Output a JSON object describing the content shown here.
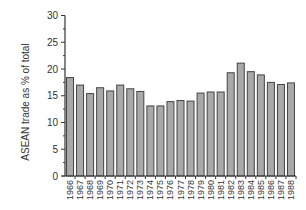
{
  "chart_data": {
    "type": "bar",
    "title": "",
    "xlabel": "",
    "ylabel": "ASEAN trade as % of total",
    "ylim": [
      0,
      30
    ],
    "yticks": [
      0,
      5,
      10,
      15,
      20,
      25,
      30
    ],
    "grid": false,
    "legend": null,
    "categories": [
      "1966",
      "1967",
      "1968",
      "1969",
      "1970",
      "1971",
      "1972",
      "1973",
      "1974",
      "1975",
      "1976",
      "1977",
      "1978",
      "1979",
      "1980",
      "1981",
      "1982",
      "1983",
      "1984",
      "1985",
      "1986",
      "1987",
      "1988"
    ],
    "values": [
      18.4,
      17.0,
      15.4,
      16.5,
      15.9,
      17.0,
      16.3,
      15.8,
      13.1,
      13.1,
      13.9,
      14.1,
      14.0,
      15.5,
      15.7,
      15.7,
      19.3,
      21.1,
      19.5,
      18.9,
      17.5,
      17.1,
      17.4
    ]
  },
  "colors": {
    "bar_fill": "#a9a9a9",
    "bar_stroke": "#444444",
    "axis": "#333333",
    "text": "#333333"
  }
}
